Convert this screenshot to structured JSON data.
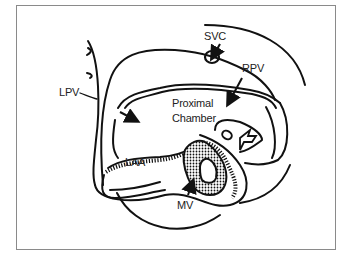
{
  "figure": {
    "type": "anatomical-schematic",
    "labels": {
      "svc": "SVC",
      "rpv": "RPV",
      "lpv": "LPV",
      "proximal_chamber_line1": "Proximal",
      "proximal_chamber_line2": "Chamber",
      "laa": "LAA",
      "mv": "MV"
    },
    "colors": {
      "stroke": "#111111",
      "frame": "#8a8a8a",
      "background": "#ffffff",
      "label": "#222222"
    }
  }
}
